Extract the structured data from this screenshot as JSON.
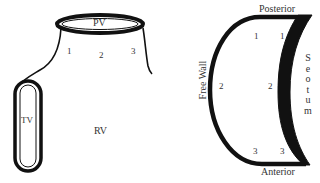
{
  "left_diagram": {
    "valve_top": "PV",
    "valve_side": "TV",
    "chamber": "RV",
    "segments": [
      "1",
      "2",
      "3"
    ]
  },
  "right_diagram": {
    "top_label": "Posterior",
    "bottom_label": "Anterior",
    "left_label": "Free Wall",
    "right_label_letters": [
      "S",
      "e",
      "o",
      "t",
      "u",
      "m"
    ],
    "segments": {
      "top_left": "1",
      "top_right": "1",
      "mid_left": "2",
      "mid_center": "2",
      "bottom_left": "3",
      "bottom_right": "3"
    }
  }
}
